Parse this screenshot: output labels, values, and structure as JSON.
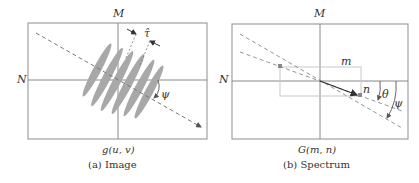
{
  "figure_a": {
    "axis_top": "M",
    "axis_left": "N",
    "angle_label": "ψ",
    "spacing_label": "τ̂",
    "function_label": "g(u, v)",
    "caption": "(a) Image"
  },
  "figure_b": {
    "axis_top": "M",
    "axis_left": "N",
    "box_width_label": "m",
    "box_height_label": "n",
    "angle_theta": "θ",
    "angle_psi": "ψ",
    "function_label": "G(m, n)",
    "caption": "(b) Spectrum"
  },
  "colors": {
    "frame": "#a0a0a0",
    "stripe": "#a8a8a8",
    "dashed": "#777777",
    "vector": "#333333"
  }
}
